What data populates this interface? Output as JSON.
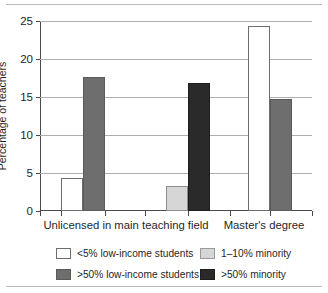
{
  "chart_data": {
    "type": "bar",
    "title": "",
    "xlabel": "",
    "ylabel": "Percentage of teachers",
    "ylim": [
      0,
      25
    ],
    "yticks": [
      0,
      5,
      10,
      15,
      20,
      25
    ],
    "ytick_labels": [
      "0",
      "5",
      "10",
      "15",
      "20",
      "25"
    ],
    "grid": true,
    "legend_position": "bottom",
    "categories": [
      "Unlicensed in main teaching field",
      "Master's degree"
    ],
    "series": [
      {
        "name": "<5% low-income students",
        "color": "#ffffff",
        "swatch": "white",
        "values": [
          4.4,
          24.4
        ]
      },
      {
        "name": ">50% low-income students",
        "color": "#6e6e6e",
        "swatch": "midgray",
        "values": [
          17.6,
          14.8
        ]
      },
      {
        "name": "1–10% minority",
        "color": "#d6d6d6",
        "swatch": "lightgray",
        "values": [
          3.3,
          null
        ]
      },
      {
        "name": ">50% minority",
        "color": "#2a2a2a",
        "swatch": "black",
        "values": [
          16.9,
          null
        ]
      }
    ],
    "bars": [
      {
        "label": "<5% low-income students",
        "group": "Unlicensed in main teaching field",
        "value": 4.4,
        "swatch": "white"
      },
      {
        "label": ">50% low-income students",
        "group": "Unlicensed in main teaching field",
        "value": 17.6,
        "swatch": "midgray"
      },
      {
        "label": "1–10% minority",
        "group": "Unlicensed in main teaching field",
        "value": 3.3,
        "swatch": "lightgray"
      },
      {
        "label": ">50% minority",
        "group": "Unlicensed in main teaching field",
        "value": 16.9,
        "swatch": "black"
      },
      {
        "label": "<5% low-income students",
        "group": "Master's degree",
        "value": 24.4,
        "swatch": "white"
      },
      {
        "label": ">50% low-income students",
        "group": "Master's degree",
        "value": 14.8,
        "swatch": "midgray"
      }
    ]
  },
  "axis": {
    "y_title": "Percentage of teachers",
    "y_labels": [
      "0",
      "5",
      "10",
      "15",
      "20",
      "25"
    ],
    "x_labels": [
      "Unlicensed in main teaching field",
      "Master's degree"
    ]
  },
  "legend": {
    "entries": [
      {
        "label": "<5% low-income students",
        "swatch": "white"
      },
      {
        "label": "1–10% minority",
        "swatch": "lightgray"
      },
      {
        "label": ">50% low-income students",
        "swatch": "midgray"
      },
      {
        "label": ">50% minority",
        "swatch": "black"
      }
    ]
  }
}
